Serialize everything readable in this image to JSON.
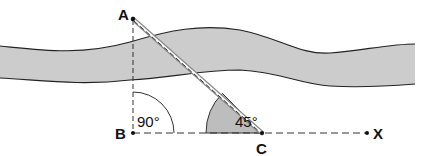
{
  "diagram": {
    "points": {
      "A": {
        "label": "A"
      },
      "B": {
        "label": "B"
      },
      "C": {
        "label": "C"
      },
      "X": {
        "label": "X"
      }
    },
    "angles": {
      "right_angle": {
        "label": "90°",
        "at": "B"
      },
      "cut_angle": {
        "label": "45°",
        "at": "C"
      }
    },
    "colors": {
      "river_fill": "#cccccc",
      "river_edge": "#222222",
      "lines": "#333333",
      "angle_fill": "#bdbdbd"
    }
  }
}
